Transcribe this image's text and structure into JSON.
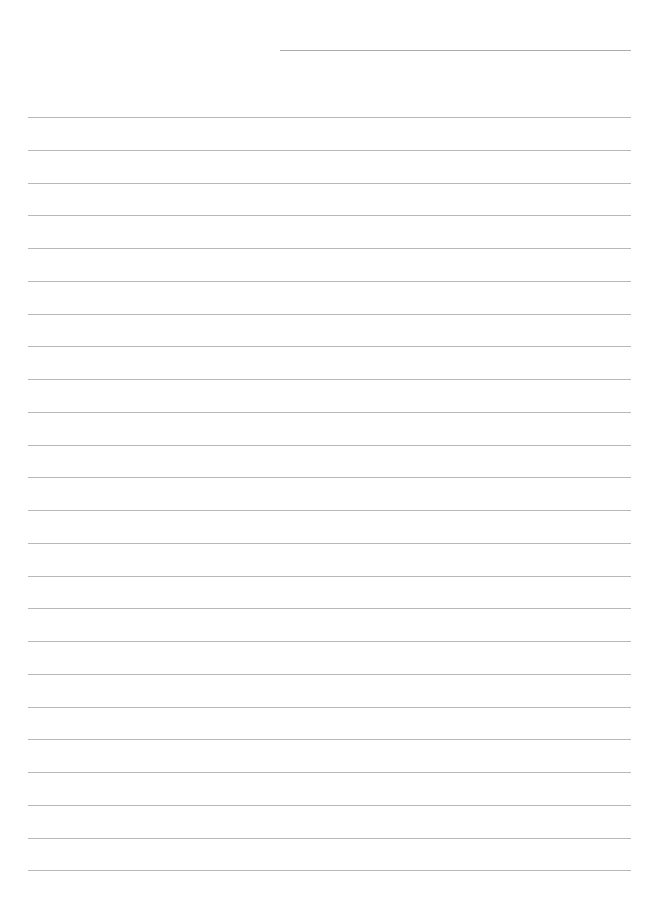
{
  "document": {
    "type": "lined-paper",
    "background_color": "#ffffff",
    "line_color": "#a6a6a6",
    "header_line": {
      "left": 280,
      "right": 631,
      "y": 50
    },
    "ruled_lines": {
      "left": 28,
      "right": 631,
      "first_y": 117,
      "spacing": 32.75,
      "count": 24
    }
  }
}
